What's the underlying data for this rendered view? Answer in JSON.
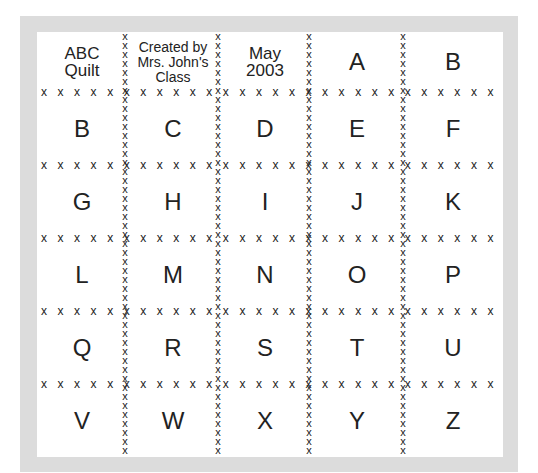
{
  "quilt": {
    "colors": {
      "frame": "#dcdcdc",
      "background": "#ffffff",
      "text": "#222222"
    },
    "header_cells": [
      {
        "lines": [
          "ABC",
          "Quilt"
        ]
      },
      {
        "lines": [
          "Created by",
          "Mrs. John's",
          "Class"
        ]
      },
      {
        "lines": [
          "May",
          "2003"
        ]
      },
      {
        "letter": "A"
      },
      {
        "letter": "B"
      }
    ],
    "rows": [
      [
        "B",
        "C",
        "D",
        "E",
        "F"
      ],
      [
        "G",
        "H",
        "I",
        "J",
        "K"
      ],
      [
        "L",
        "M",
        "N",
        "O",
        "P"
      ],
      [
        "Q",
        "R",
        "S",
        "T",
        "U"
      ],
      [
        "V",
        "W",
        "X",
        "Y",
        "Z"
      ]
    ],
    "stitch_glyph": "x"
  }
}
